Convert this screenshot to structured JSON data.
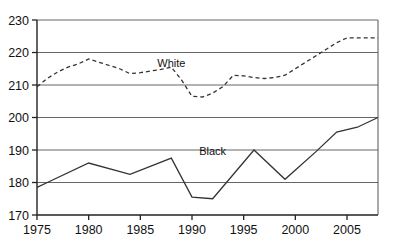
{
  "chart_data": {
    "type": "line",
    "title": "",
    "subtitle": "",
    "xlabel": "",
    "ylabel": "",
    "xlim": [
      1975,
      2008
    ],
    "ylim": [
      170,
      230
    ],
    "yticks": [
      170,
      180,
      190,
      200,
      210,
      220,
      230
    ],
    "xticks": [
      1975,
      1980,
      1985,
      1990,
      1995,
      2000,
      2005
    ],
    "ytick_labels": [
      "170",
      "180",
      "190",
      "200",
      "210",
      "220",
      "230"
    ],
    "xtick_labels": [
      "1975",
      "1980",
      "1985",
      "1990",
      "1995",
      "2000",
      "2005"
    ],
    "grid": "horizontal",
    "legend_position": "inline-annotation",
    "series": [
      {
        "name": "White",
        "style": "dashed",
        "color": "#333333",
        "label_x": 1988,
        "label_y": 215.5,
        "x": [
          1975,
          1976,
          1977,
          1978,
          1979,
          1980,
          1981,
          1982,
          1983,
          1984,
          1985,
          1986,
          1987,
          1988,
          1989,
          1990,
          1991,
          1992,
          1993,
          1994,
          1995,
          1996,
          1997,
          1998,
          1999,
          2000,
          2001,
          2002,
          2003,
          2004,
          2005,
          2006,
          2007,
          2008
        ],
        "values": [
          209.5,
          212.0,
          214.0,
          215.5,
          216.5,
          218.0,
          217.0,
          216.0,
          215.0,
          213.5,
          213.8,
          214.3,
          214.8,
          215.5,
          211.5,
          206.5,
          206.3,
          207.5,
          209.5,
          213.0,
          212.8,
          212.3,
          212.0,
          212.3,
          213.0,
          215.0,
          217.0,
          219.0,
          221.0,
          223.0,
          224.5,
          224.5,
          224.5,
          224.5
        ]
      },
      {
        "name": "Black",
        "style": "solid",
        "color": "#333333",
        "label_x": 1992,
        "label_y": 188.5,
        "x": [
          1975,
          1976,
          1980,
          1984,
          1988,
          1990,
          1992,
          1996,
          1999,
          2002,
          2004,
          2006,
          2008
        ],
        "values": [
          178.5,
          180.0,
          186.0,
          182.5,
          187.5,
          175.5,
          175.0,
          190.0,
          181.0,
          189.5,
          195.5,
          197.0,
          200.0
        ]
      }
    ]
  },
  "annotations": {
    "white_label": "White",
    "black_label": "Black"
  }
}
